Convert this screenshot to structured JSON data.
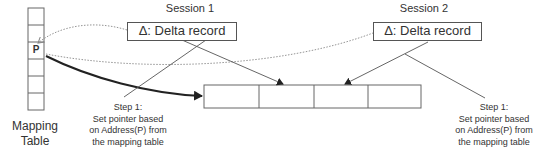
{
  "mapping_table": {
    "label_line1": "Mapping",
    "label_line2": "Table",
    "pointer_label": "P",
    "row_count": 6,
    "pointer_row": 2
  },
  "sessions": [
    {
      "title": "Session 1",
      "record_label": "Δ: Delta record",
      "step": {
        "line1": "Step 1:",
        "line2": "Set pointer based",
        "line3": "on Address(P) from",
        "line4": "the mapping table"
      }
    },
    {
      "title": "Session 2",
      "record_label": "Δ: Delta record",
      "step": {
        "line1": "Step 1:",
        "line2": "Set pointer based",
        "line3": "on Address(P) from",
        "line4": "the mapping table"
      }
    }
  ],
  "record_chain": {
    "cell_count": 4
  },
  "colors": {
    "line": "#555555",
    "dotted": "#888888",
    "bold_arrow": "#333333"
  }
}
